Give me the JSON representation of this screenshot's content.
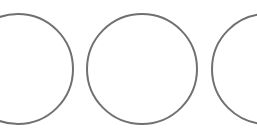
{
  "strip": {
    "stroke_color": "#707070",
    "stroke_width": 2,
    "background": "#ffffff",
    "circles": [
      {
        "id": "circle-1",
        "cx": 18,
        "cy": 69,
        "d": 112,
        "visible": "clipped-left"
      },
      {
        "id": "circle-2",
        "cx": 142,
        "cy": 69,
        "d": 112,
        "visible": "full"
      },
      {
        "id": "circle-3",
        "cx": 267,
        "cy": 69,
        "d": 112,
        "visible": "clipped-right"
      }
    ]
  }
}
